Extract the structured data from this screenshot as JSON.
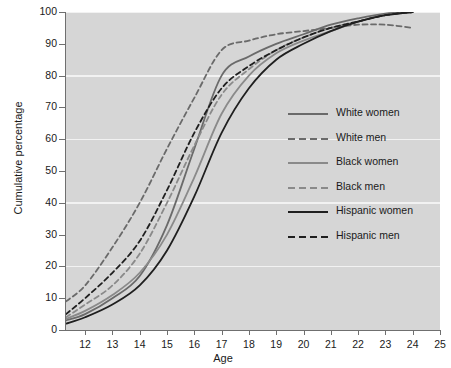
{
  "chart_data": {
    "type": "line",
    "title": "",
    "xlabel": "Age",
    "ylabel": "Cumulative percentage",
    "xlim": [
      11.3,
      25
    ],
    "ylim": [
      0,
      100
    ],
    "grid": true,
    "grid_values": [
      20,
      40,
      60,
      80,
      100
    ],
    "legend_position": "right-middle",
    "xticks": [
      12,
      13,
      14,
      15,
      16,
      17,
      18,
      19,
      20,
      21,
      22,
      23,
      24,
      25
    ],
    "yticks": [
      0,
      10,
      20,
      30,
      40,
      50,
      60,
      70,
      80,
      90,
      100
    ],
    "x": [
      11.3,
      12,
      13,
      14,
      15,
      16,
      17,
      18,
      19,
      20,
      21,
      22,
      23,
      24
    ],
    "series": [
      {
        "name": "White women",
        "style": "solid",
        "color": "#6a6a6a",
        "width": 1.8,
        "values": [
          3,
          5,
          10,
          17,
          33,
          57,
          80,
          86,
          90,
          93,
          96,
          98,
          99.5,
          100
        ]
      },
      {
        "name": "White men",
        "style": "dashed",
        "color": "#6a6a6a",
        "width": 1.8,
        "values": [
          9,
          14,
          26,
          40,
          57,
          73,
          88,
          91,
          93,
          94,
          95,
          96,
          96,
          95
        ]
      },
      {
        "name": "Black women",
        "style": "solid",
        "color": "#8a8a8a",
        "width": 1.8,
        "values": [
          3.5,
          6,
          11,
          18,
          30,
          48,
          68,
          80,
          87,
          91,
          94,
          97,
          99,
          100
        ]
      },
      {
        "name": "Black men",
        "style": "dashed",
        "color": "#8a8a8a",
        "width": 1.8,
        "values": [
          4,
          8,
          14,
          24,
          40,
          58,
          74,
          82,
          88,
          92,
          95,
          97,
          99,
          100
        ]
      },
      {
        "name": "Hispanic women",
        "style": "solid",
        "color": "#1f1f1f",
        "width": 1.8,
        "values": [
          2,
          4,
          8,
          14,
          25,
          42,
          62,
          76,
          85,
          90,
          94,
          97,
          99,
          100
        ]
      },
      {
        "name": "Hispanic men",
        "style": "dashed",
        "color": "#1f1f1f",
        "width": 1.8,
        "values": [
          5,
          10,
          18,
          28,
          44,
          62,
          76,
          83,
          88,
          92,
          95,
          97,
          99,
          100
        ]
      }
    ]
  },
  "axes": {
    "x_title": "Age",
    "y_title": "Cumulative percentage",
    "x_tick_labels": [
      "12",
      "13",
      "14",
      "15",
      "16",
      "17",
      "18",
      "19",
      "20",
      "21",
      "22",
      "23",
      "24",
      "25"
    ],
    "y_tick_labels": [
      "0",
      "10",
      "20",
      "30",
      "40",
      "50",
      "60",
      "70",
      "80",
      "90",
      "100"
    ]
  },
  "legend": {
    "items": [
      {
        "label": "White women"
      },
      {
        "label": "White men"
      },
      {
        "label": "Black women"
      },
      {
        "label": "Black men"
      },
      {
        "label": "Hispanic women"
      },
      {
        "label": "Hispanic men"
      }
    ]
  },
  "colors": {
    "plot_background": "#d6d6d6",
    "gridline": "#f2f2f2",
    "axis": "#6f6f6f",
    "text": "#1a1a1a"
  }
}
